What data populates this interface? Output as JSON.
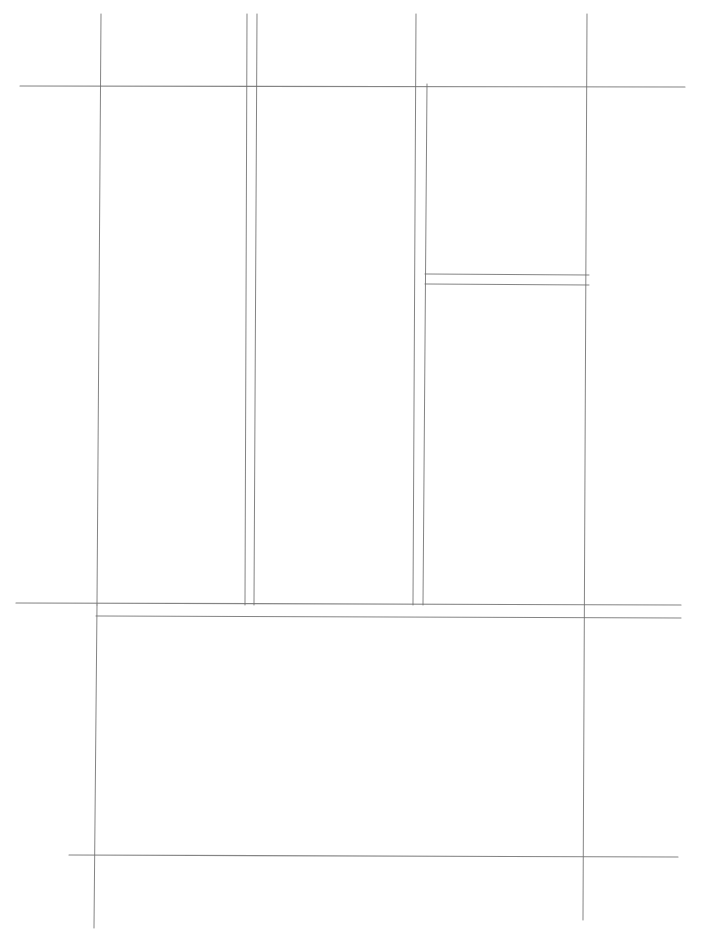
{
  "canvas": {
    "width": 703,
    "height": 950,
    "background": "#ffffff"
  },
  "style": {
    "stroke": "#6e6e6e",
    "stroke_light": "#9a9a9a"
  },
  "lines": [
    {
      "id": "h-top",
      "x1": 20,
      "y1": 86,
      "x2": 685,
      "y2": 87,
      "w": 1.1,
      "light": false
    },
    {
      "id": "v-left",
      "x1": 101,
      "y1": 14,
      "x2": 97,
      "y2": 605,
      "w": 1.0,
      "light": false
    },
    {
      "id": "v-col1-a",
      "x1": 247,
      "y1": 14,
      "x2": 245,
      "y2": 605,
      "w": 1.0,
      "light": false
    },
    {
      "id": "v-col1-b",
      "x1": 257,
      "y1": 14,
      "x2": 254,
      "y2": 605,
      "w": 1.0,
      "light": false
    },
    {
      "id": "v-col2-a",
      "x1": 416,
      "y1": 14,
      "x2": 413,
      "y2": 605,
      "w": 1.0,
      "light": false
    },
    {
      "id": "v-col2-b",
      "x1": 427,
      "y1": 84,
      "x2": 423,
      "y2": 605,
      "w": 1.0,
      "light": false
    },
    {
      "id": "v-right",
      "x1": 587,
      "y1": 14,
      "x2": 583,
      "y2": 920,
      "w": 1.0,
      "light": false
    },
    {
      "id": "h-sidebox-a",
      "x1": 425,
      "y1": 274,
      "x2": 589,
      "y2": 275,
      "w": 1.0,
      "light": false
    },
    {
      "id": "h-sidebox-b",
      "x1": 425,
      "y1": 284,
      "x2": 589,
      "y2": 285,
      "w": 1.0,
      "light": false
    },
    {
      "id": "h-mid-a",
      "x1": 16,
      "y1": 603,
      "x2": 681,
      "y2": 605,
      "w": 1.2,
      "light": false
    },
    {
      "id": "h-mid-b",
      "x1": 96,
      "y1": 616,
      "x2": 681,
      "y2": 618,
      "w": 1.0,
      "light": false
    },
    {
      "id": "v-lower-left",
      "x1": 97,
      "y1": 605,
      "x2": 94,
      "y2": 928,
      "w": 1.0,
      "light": false
    },
    {
      "id": "h-bottom",
      "x1": 69,
      "y1": 855,
      "x2": 678,
      "y2": 857,
      "w": 1.1,
      "light": false
    }
  ],
  "regions": [
    {
      "name": "column-1",
      "x": 101,
      "y": 87,
      "w": 145,
      "h": 516
    },
    {
      "name": "column-2",
      "x": 257,
      "y": 87,
      "w": 157,
      "h": 516
    },
    {
      "name": "column-3-upper",
      "x": 427,
      "y": 87,
      "w": 158,
      "h": 187
    },
    {
      "name": "column-3-lower",
      "x": 427,
      "y": 285,
      "w": 158,
      "h": 318
    },
    {
      "name": "lower-panel",
      "x": 97,
      "y": 618,
      "w": 487,
      "h": 237
    }
  ]
}
